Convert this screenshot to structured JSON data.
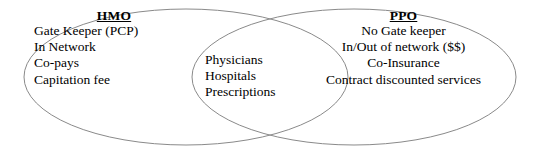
{
  "diagram": {
    "type": "venn-2-set",
    "background_color": "#ffffff",
    "text_color": "#000000",
    "ellipse_stroke_color": "#8a8a8a",
    "ellipse_fill": "none",
    "ellipse_stroke_width": 1,
    "left_set": {
      "title": "HMO",
      "items": [
        "Gate Keeper (PCP)",
        "In Network",
        "Co-pays",
        "Capitation fee"
      ]
    },
    "intersection": {
      "items": [
        "Physicians",
        "Hospitals",
        "Prescriptions"
      ]
    },
    "right_set": {
      "title": "PPO",
      "items": [
        "No Gate keeper",
        "In/Out of network ($$)",
        "Co-Insurance",
        "Contract discounted services"
      ]
    }
  }
}
